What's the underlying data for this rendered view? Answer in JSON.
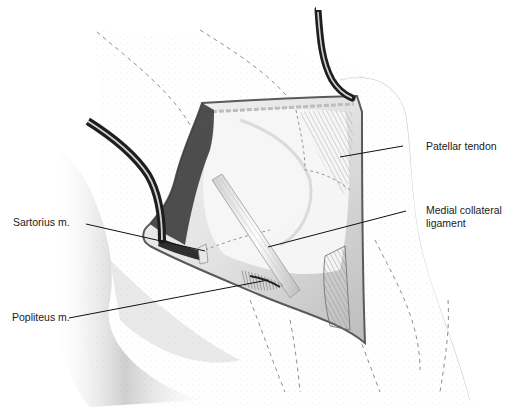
{
  "figure": {
    "background": "#ffffff",
    "colors": {
      "skin_shade": "#d9d9d9",
      "wound_edge": "#5a5a5a",
      "retractor_dark": "#2a2a2a",
      "retractor_light": "#9a9a9a",
      "dashed_line": "#8a8a8a",
      "leader_line": "#111111",
      "label_text": "#1a1a1a"
    }
  },
  "labels": [
    {
      "id": "patellar-tendon",
      "text": "Patellar tendon",
      "x": 426,
      "y": 140,
      "line": {
        "x1": 403,
        "y1": 146,
        "x2": 340,
        "y2": 157
      }
    },
    {
      "id": "medial-collateral-ligament",
      "text_line1": "Medial collateral",
      "text_line2": "ligament",
      "x": 426,
      "y": 204,
      "line": {
        "x1": 406,
        "y1": 211,
        "x2": 268,
        "y2": 247
      }
    },
    {
      "id": "sartorius",
      "text": "Sartorius m.",
      "x": 13,
      "y": 216,
      "line": {
        "x1": 86,
        "y1": 224,
        "x2": 205,
        "y2": 251
      }
    },
    {
      "id": "popliteus",
      "text": "Popliteus m.",
      "x": 12,
      "y": 311,
      "line": {
        "x1": 69,
        "y1": 318,
        "x2": 268,
        "y2": 280
      }
    }
  ],
  "structures": [
    {
      "name": "incision-wound"
    },
    {
      "name": "upper-retractor"
    },
    {
      "name": "left-retractor"
    },
    {
      "name": "medial-collateral-ligament-band"
    },
    {
      "name": "patellar-tendon-fibers"
    },
    {
      "name": "popliteus-muscle"
    },
    {
      "name": "sartorius-muscle"
    },
    {
      "name": "femoral-condyle"
    }
  ]
}
